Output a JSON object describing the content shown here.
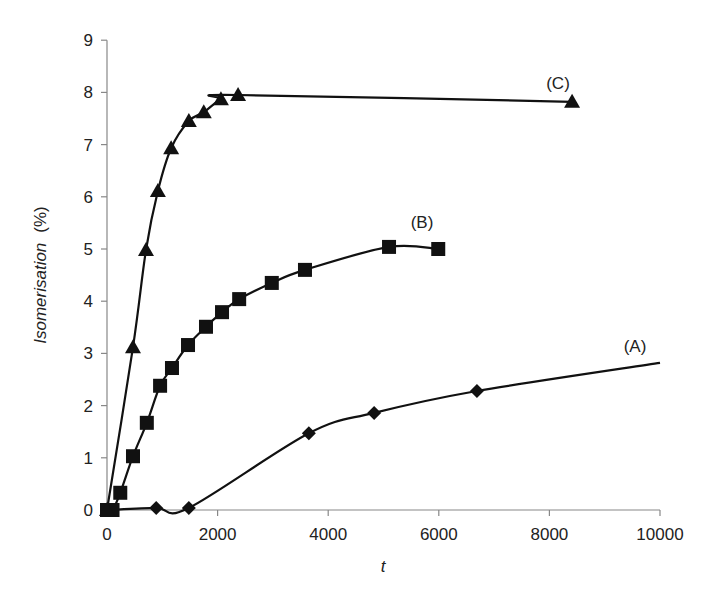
{
  "chart_data": {
    "type": "line",
    "title": "",
    "xlabel": "t",
    "ylabel": "Isomerisation",
    "ylabel_unit": "(%)",
    "xlim": [
      0,
      10000
    ],
    "ylim": [
      0,
      9
    ],
    "xticks": [
      0,
      2000,
      4000,
      6000,
      8000,
      10000
    ],
    "yticks": [
      0,
      1,
      2,
      3,
      4,
      5,
      6,
      7,
      8,
      9
    ],
    "grid": false,
    "legend": "none (inline labels)",
    "line_color": "#111111",
    "axis_color": "#888888",
    "series": [
      {
        "name": "(A)",
        "marker": "diamond",
        "points": [
          [
            0,
            0
          ],
          [
            890,
            0.04
          ],
          [
            1480,
            0.04
          ],
          [
            3650,
            1.47
          ],
          [
            4830,
            1.86
          ],
          [
            6690,
            2.28
          ]
        ],
        "trend_end": [
          10000,
          2.82
        ],
        "label_pos": [
          635,
          352
        ]
      },
      {
        "name": "(B)",
        "marker": "square",
        "points": [
          [
            0,
            0
          ],
          [
            100,
            0
          ],
          [
            240,
            0.33
          ],
          [
            470,
            1.03
          ],
          [
            720,
            1.67
          ],
          [
            960,
            2.38
          ],
          [
            1175,
            2.72
          ],
          [
            1465,
            3.16
          ],
          [
            1790,
            3.51
          ],
          [
            2080,
            3.79
          ],
          [
            2390,
            4.04
          ],
          [
            2980,
            4.35
          ],
          [
            3580,
            4.6
          ],
          [
            5100,
            5.04
          ],
          [
            5990,
            5.0
          ]
        ],
        "label_pos": [
          422,
          228
        ]
      },
      {
        "name": "(C)",
        "marker": "triangle",
        "points": [
          [
            0,
            0
          ],
          [
            470,
            3.12
          ],
          [
            705,
            4.98
          ],
          [
            920,
            6.11
          ],
          [
            1160,
            6.93
          ],
          [
            1480,
            7.45
          ],
          [
            1750,
            7.62
          ],
          [
            2060,
            7.87
          ],
          [
            2370,
            7.95
          ],
          [
            8410,
            7.82
          ]
        ],
        "label_pos": [
          558,
          89
        ]
      }
    ]
  }
}
